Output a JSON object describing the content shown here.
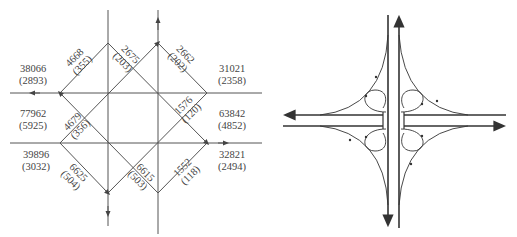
{
  "figure": {
    "left": {
      "title": "Volume distribution diagram (diamond ramp layout)",
      "approach_volumes": [
        {
          "id": "nw",
          "value": "38066",
          "sub": "(2893)"
        },
        {
          "id": "ne",
          "value": "31021",
          "sub": "(2358)"
        },
        {
          "id": "w",
          "value": "77962",
          "sub": "(5925)"
        },
        {
          "id": "e",
          "value": "63842",
          "sub": "(4852)"
        },
        {
          "id": "sw",
          "value": "39896",
          "sub": "(3032)"
        },
        {
          "id": "se",
          "value": "32821",
          "sub": "(2494)"
        }
      ],
      "ramp_volumes": [
        {
          "id": "r1",
          "value": "4668",
          "sub": "(355)"
        },
        {
          "id": "r2",
          "value": "2675",
          "sub": "(203)"
        },
        {
          "id": "r3",
          "value": "2662",
          "sub": "(202)"
        },
        {
          "id": "r4",
          "value": "1576",
          "sub": "(120)"
        },
        {
          "id": "r5",
          "value": "4679",
          "sub": "(356)"
        },
        {
          "id": "r6",
          "value": "6625",
          "sub": "(504)"
        },
        {
          "id": "r7",
          "value": "6615",
          "sub": "(503)"
        },
        {
          "id": "r8",
          "value": "1552",
          "sub": "(118)"
        }
      ]
    },
    "right": {
      "title": "Cloverleaf interchange schematic",
      "loops": 4,
      "outer_ramps": 4
    },
    "colors": {
      "line": "#444444",
      "text": "#444444",
      "background": "#ffffff"
    }
  }
}
